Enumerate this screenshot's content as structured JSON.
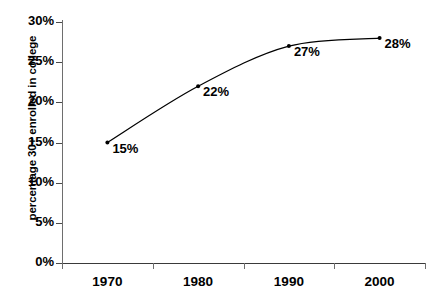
{
  "chart_data": {
    "type": "line",
    "title": "",
    "xlabel": "",
    "ylabel": "percentage 30+ enrolled in college",
    "categories": [
      "1970",
      "1980",
      "1990",
      "2000"
    ],
    "values": [
      15,
      22,
      27,
      28
    ],
    "point_labels": [
      "15%",
      "22%",
      "27%",
      "28%"
    ],
    "ylim": [
      0,
      30
    ],
    "ytick_labels": [
      "0%",
      "5%",
      "10%",
      "15%",
      "20%",
      "25%",
      "30%"
    ],
    "ytick_values": [
      0,
      5,
      10,
      15,
      20,
      25,
      30
    ],
    "grid": false,
    "legend": false,
    "series": [
      {
        "name": "percentage 30+ enrolled in college",
        "values": [
          15,
          22,
          27,
          28
        ]
      }
    ],
    "line_color": "#000000",
    "marker": "small-dot",
    "smoothing": true
  }
}
